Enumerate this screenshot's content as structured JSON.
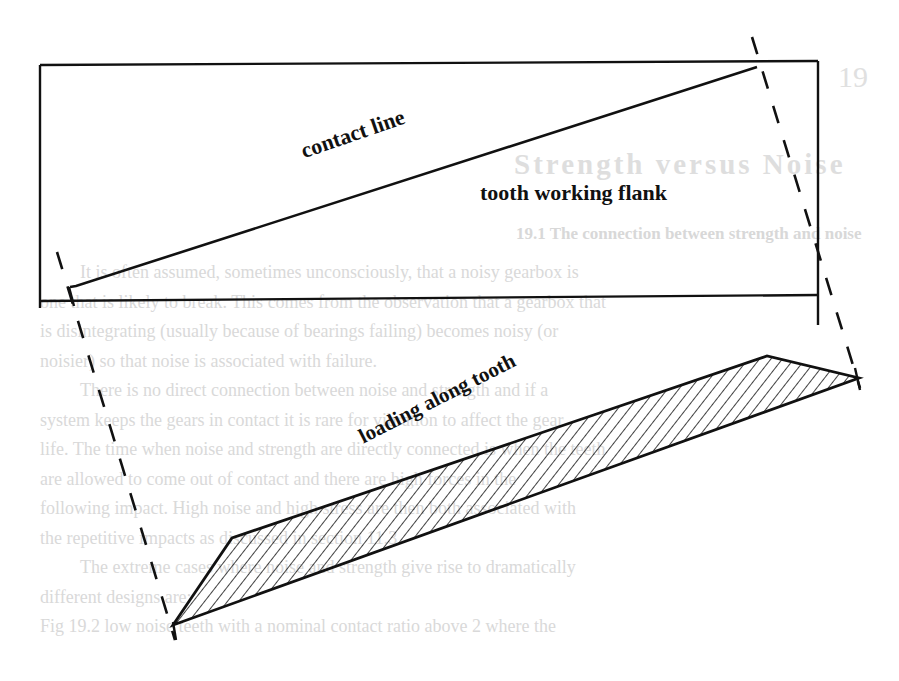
{
  "figure": {
    "labels": {
      "contact_line": "contact line",
      "tooth_working_flank": "tooth working flank",
      "loading_along_tooth": "loading along tooth"
    },
    "colors": {
      "ink": "#111111",
      "bleed_through": "#d9d9d9",
      "paper": "#ffffff"
    }
  },
  "bleed_through": {
    "chapter_number": "19",
    "chapter_title": "Strength versus Noise",
    "section_title": "19.1 The connection between strength and noise",
    "paragraph_lines": [
      "It is often assumed, sometimes unconsciously, that a noisy gearbox is",
      "one that is likely to break.  This comes from the observation that a gearbox that",
      "is disintegrating (usually because of bearings failing) becomes noisy (or",
      "noisier) so that noise is associated with failure.",
      "There is no direct connection between noise and strength and if a",
      "system keeps the gears in contact it is rare for vibration to affect the gear",
      "life.  The time when noise and strength are directly connected is when the teeth",
      "are allowed to come out of contact and there are high forces in the",
      "following impact.  High noise and high stress are then both associated with",
      "the repetitive impacts as discussed in section 11.3.",
      "The extreme cases where noise and strength give rise to dramatically",
      "different designs are:",
      "Fig 19.2   low noise teeth with a nominal contact ratio above 2 where the"
    ]
  }
}
